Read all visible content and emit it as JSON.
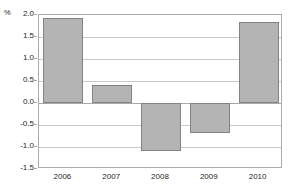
{
  "chart_data": {
    "type": "bar",
    "title": "",
    "subtitle": "",
    "xlabel": "",
    "ylabel": "",
    "unit_label": "%",
    "categories": [
      "2006",
      "2007",
      "2008",
      "2009",
      "2010"
    ],
    "values": [
      1.93,
      0.42,
      -1.08,
      -0.68,
      1.83
    ],
    "series": [
      {
        "name": "",
        "values": [
          1.93,
          0.42,
          -1.08,
          -0.68,
          1.83
        ]
      }
    ],
    "ylim": [
      -1.5,
      2.0
    ],
    "ytick_labels": [
      "2.0",
      "1.5",
      "1.0",
      "0.5",
      "0.0",
      "-0.5",
      "-1.0",
      "-1.5"
    ],
    "ytick_values": [
      2.0,
      1.5,
      1.0,
      0.5,
      0.0,
      -0.5,
      -1.0,
      -1.5
    ],
    "grid": true,
    "legend": null,
    "legend_position": "none",
    "annotations": [],
    "colors": {
      "bar_fill": "#b4b4b4",
      "bar_border": "#828282",
      "gridline": "#c8c9cb",
      "axis": "#a7a9ac",
      "text": "#231f20",
      "background": "#ffffff"
    }
  }
}
